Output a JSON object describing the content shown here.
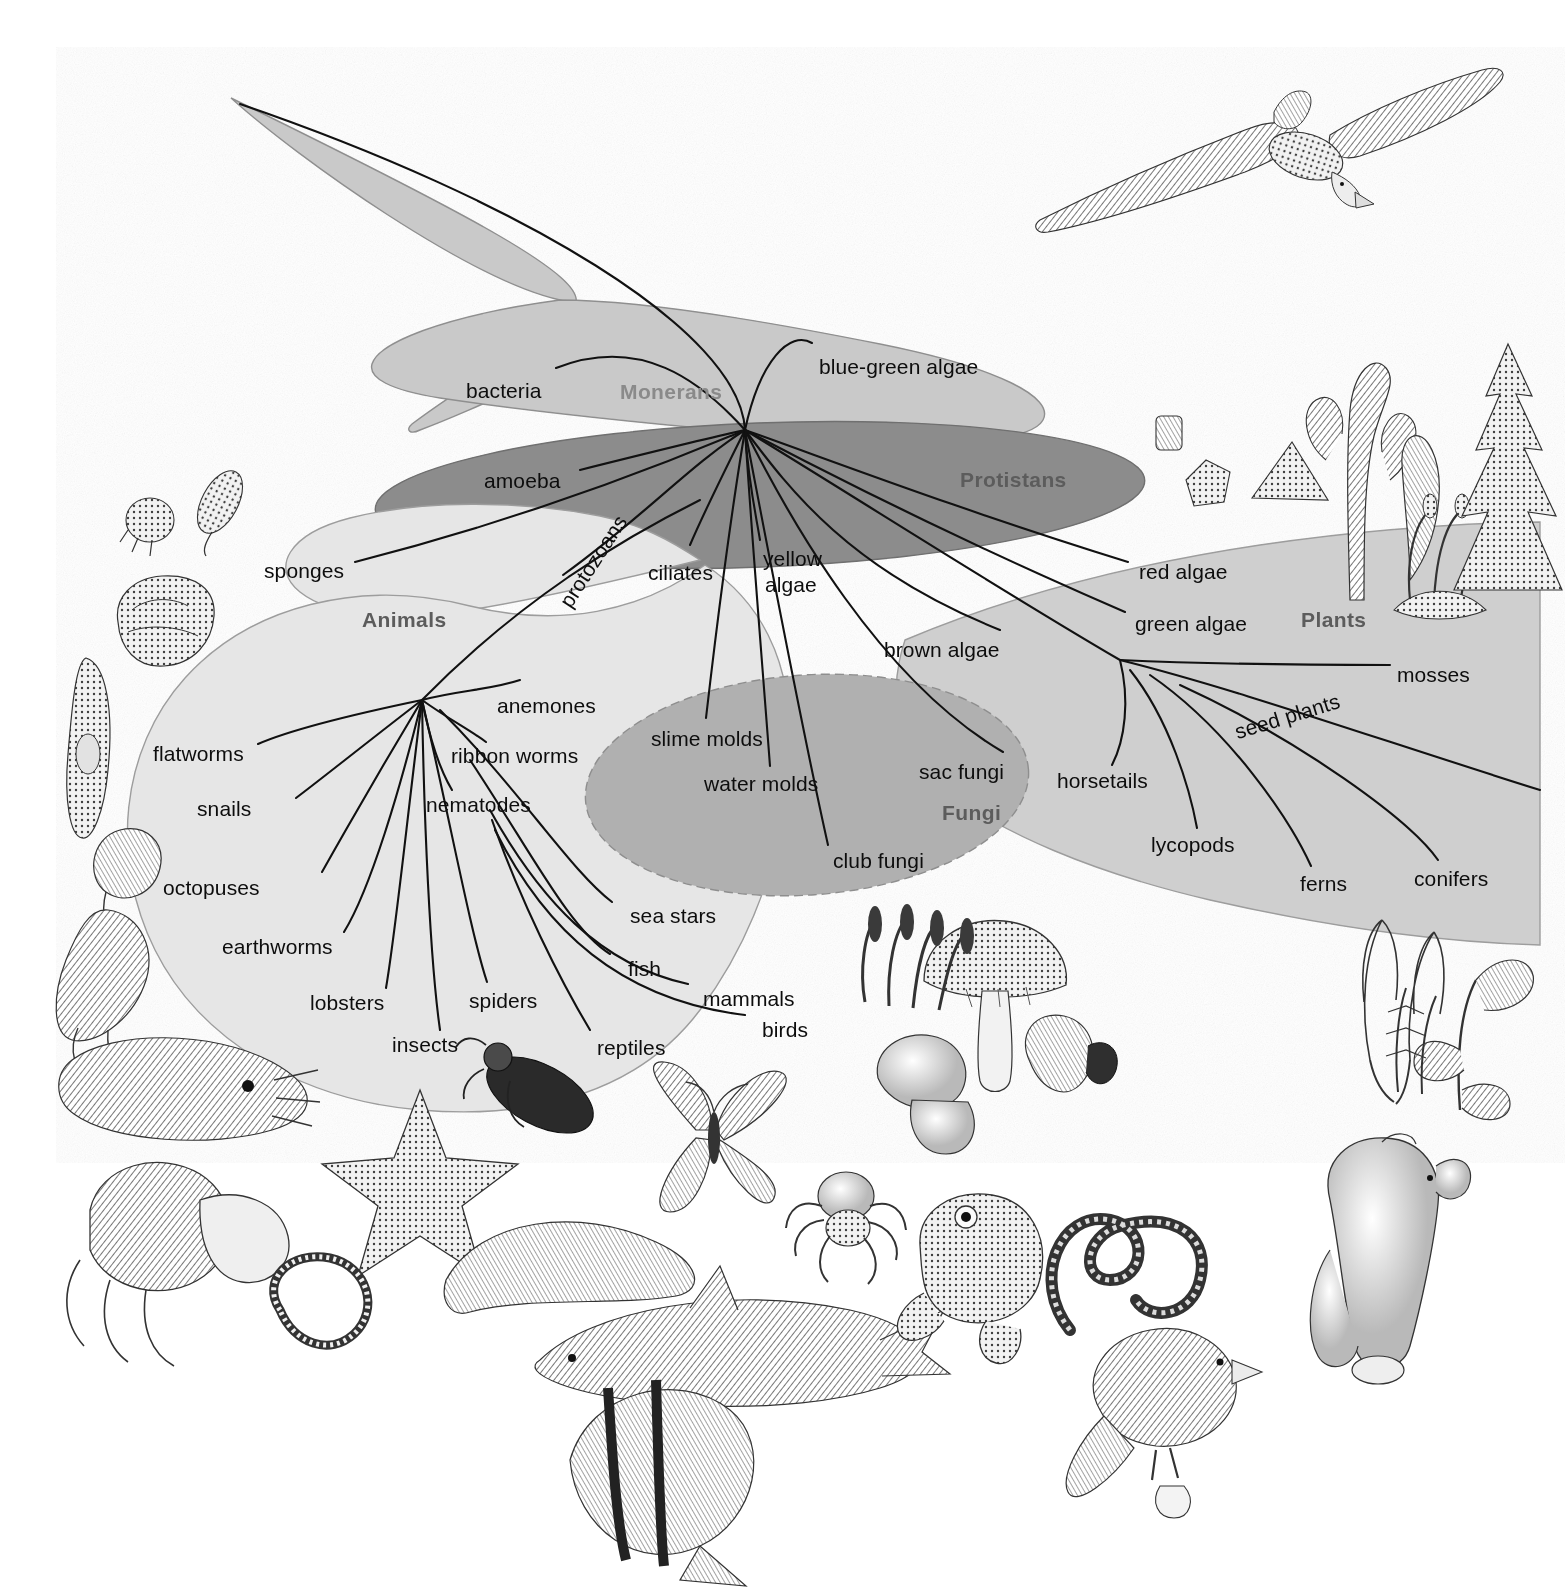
{
  "figure": {
    "top_caption": "",
    "background": "#ffffff"
  },
  "colors": {
    "monerans_fill": "#c9c9c9",
    "protistans_fill": "#8c8c8c",
    "animals_fill": "#e6e6e6",
    "fungi_fill": "#b0b0b0",
    "plants_fill": "#cfcfcf",
    "branch": "#111111",
    "label_text": "#0d0d0d",
    "kingdom_label_light": "#8a8a8a",
    "kingdom_label_dark": "#5c5c5c"
  },
  "kingdoms": [
    {
      "id": "monerans",
      "label": "Monerans",
      "x": 620,
      "y": 380,
      "tone": "light"
    },
    {
      "id": "protistans",
      "label": "Protistans",
      "x": 960,
      "y": 468,
      "tone": "dark"
    },
    {
      "id": "animals",
      "label": "Animals",
      "x": 362,
      "y": 608,
      "tone": "dark"
    },
    {
      "id": "fungi",
      "label": "Fungi",
      "x": 942,
      "y": 801,
      "tone": "dark"
    },
    {
      "id": "plants",
      "label": "Plants",
      "x": 1301,
      "y": 608,
      "tone": "dark"
    }
  ],
  "branch_labels": [
    {
      "id": "bacteria",
      "text": "bacteria",
      "x": 466,
      "y": 379,
      "kingdom": "monerans"
    },
    {
      "id": "blue-green-algae",
      "text": "blue-green algae",
      "x": 819,
      "y": 355,
      "kingdom": "monerans"
    },
    {
      "id": "amoeba",
      "text": "amoeba",
      "x": 484,
      "y": 469,
      "kingdom": "protistans"
    },
    {
      "id": "protozoans",
      "text": "protozoans",
      "x": 575,
      "y": 588,
      "kingdom": "protistans",
      "rotated": "protozoans"
    },
    {
      "id": "ciliates",
      "text": "ciliates",
      "x": 648,
      "y": 561,
      "kingdom": "protistans"
    },
    {
      "id": "yellow-algae-1",
      "text": "yellow",
      "x": 763,
      "y": 547,
      "kingdom": "protistans"
    },
    {
      "id": "yellow-algae-2",
      "text": "algae",
      "x": 765,
      "y": 573,
      "kingdom": "protistans"
    },
    {
      "id": "brown-algae",
      "text": "brown algae",
      "x": 884,
      "y": 638,
      "kingdom": "protistans"
    },
    {
      "id": "red-algae",
      "text": "red algae",
      "x": 1139,
      "y": 560,
      "kingdom": "plants"
    },
    {
      "id": "green-algae",
      "text": "green algae",
      "x": 1135,
      "y": 612,
      "kingdom": "plants"
    },
    {
      "id": "mosses",
      "text": "mosses",
      "x": 1397,
      "y": 663,
      "kingdom": "plants"
    },
    {
      "id": "seed-plants",
      "text": "seed plants",
      "x": 1239,
      "y": 720,
      "kingdom": "plants",
      "rotated": "seed"
    },
    {
      "id": "horsetails",
      "text": "horsetails",
      "x": 1057,
      "y": 769,
      "kingdom": "plants"
    },
    {
      "id": "lycopods",
      "text": "lycopods",
      "x": 1151,
      "y": 833,
      "kingdom": "plants"
    },
    {
      "id": "ferns",
      "text": "ferns",
      "x": 1300,
      "y": 872,
      "kingdom": "plants"
    },
    {
      "id": "conifers",
      "text": "conifers",
      "x": 1414,
      "y": 867,
      "kingdom": "plants"
    },
    {
      "id": "sponges",
      "text": "sponges",
      "x": 264,
      "y": 559,
      "kingdom": "animals"
    },
    {
      "id": "anemones",
      "text": "anemones",
      "x": 497,
      "y": 694,
      "kingdom": "animals"
    },
    {
      "id": "ribbon-worms",
      "text": "ribbon worms",
      "x": 451,
      "y": 744,
      "kingdom": "animals"
    },
    {
      "id": "nematodes",
      "text": "nematodes",
      "x": 426,
      "y": 793,
      "kingdom": "animals"
    },
    {
      "id": "flatworms",
      "text": "flatworms",
      "x": 153,
      "y": 742,
      "kingdom": "animals"
    },
    {
      "id": "snails",
      "text": "snails",
      "x": 197,
      "y": 797,
      "kingdom": "animals"
    },
    {
      "id": "octopuses",
      "text": "octopuses",
      "x": 163,
      "y": 876,
      "kingdom": "animals"
    },
    {
      "id": "earthworms",
      "text": "earthworms",
      "x": 222,
      "y": 935,
      "kingdom": "animals"
    },
    {
      "id": "lobsters",
      "text": "lobsters",
      "x": 310,
      "y": 991,
      "kingdom": "animals"
    },
    {
      "id": "insects",
      "text": "insects",
      "x": 392,
      "y": 1033,
      "kingdom": "animals"
    },
    {
      "id": "spiders",
      "text": "spiders",
      "x": 469,
      "y": 989,
      "kingdom": "animals"
    },
    {
      "id": "sea-stars",
      "text": "sea stars",
      "x": 630,
      "y": 904,
      "kingdom": "animals"
    },
    {
      "id": "fish",
      "text": "fish",
      "x": 628,
      "y": 957,
      "kingdom": "animals"
    },
    {
      "id": "mammals",
      "text": "mammals",
      "x": 703,
      "y": 987,
      "kingdom": "animals"
    },
    {
      "id": "birds",
      "text": "birds",
      "x": 762,
      "y": 1018,
      "kingdom": "animals"
    },
    {
      "id": "reptiles",
      "text": "reptiles",
      "x": 597,
      "y": 1036,
      "kingdom": "animals"
    },
    {
      "id": "slime-molds",
      "text": "slime molds",
      "x": 651,
      "y": 727,
      "kingdom": "fungi"
    },
    {
      "id": "water-molds",
      "text": "water molds",
      "x": 704,
      "y": 772,
      "kingdom": "fungi"
    },
    {
      "id": "sac-fungi",
      "text": "sac fungi",
      "x": 919,
      "y": 760,
      "kingdom": "fungi"
    },
    {
      "id": "club-fungi",
      "text": "club fungi",
      "x": 833,
      "y": 849,
      "kingdom": "fungi"
    }
  ],
  "illustrations": [
    {
      "id": "albatross",
      "name": "soaring-albatross"
    },
    {
      "id": "sponge",
      "name": "sponge"
    },
    {
      "id": "protozoa",
      "name": "protozoans"
    },
    {
      "id": "flatworm",
      "name": "flatworm"
    },
    {
      "id": "snail",
      "name": "snail"
    },
    {
      "id": "octopus",
      "name": "octopus"
    },
    {
      "id": "cuttlefish",
      "name": "cuttlefish"
    },
    {
      "id": "hermitcrab",
      "name": "hermit-crab"
    },
    {
      "id": "seastar",
      "name": "sea-star"
    },
    {
      "id": "beetle",
      "name": "beetle"
    },
    {
      "id": "butterfly",
      "name": "butterfly"
    },
    {
      "id": "earthworm",
      "name": "earthworm"
    },
    {
      "id": "nematode",
      "name": "nematode"
    },
    {
      "id": "shark",
      "name": "shark"
    },
    {
      "id": "butterflyfish",
      "name": "butterfly-fish"
    },
    {
      "id": "spider",
      "name": "spider"
    },
    {
      "id": "frog",
      "name": "frog"
    },
    {
      "id": "snake",
      "name": "snake"
    },
    {
      "id": "finch",
      "name": "finch"
    },
    {
      "id": "polarbear",
      "name": "polar-bear"
    },
    {
      "id": "mushroom",
      "name": "mushroom"
    },
    {
      "id": "clubfungus",
      "name": "club-fungus"
    },
    {
      "id": "diatom",
      "name": "diatom"
    },
    {
      "id": "brownalga",
      "name": "brown-alga"
    },
    {
      "id": "moss",
      "name": "moss"
    },
    {
      "id": "conifer",
      "name": "conifer"
    },
    {
      "id": "fern",
      "name": "fern"
    },
    {
      "id": "flower",
      "name": "flowering-plant"
    }
  ]
}
